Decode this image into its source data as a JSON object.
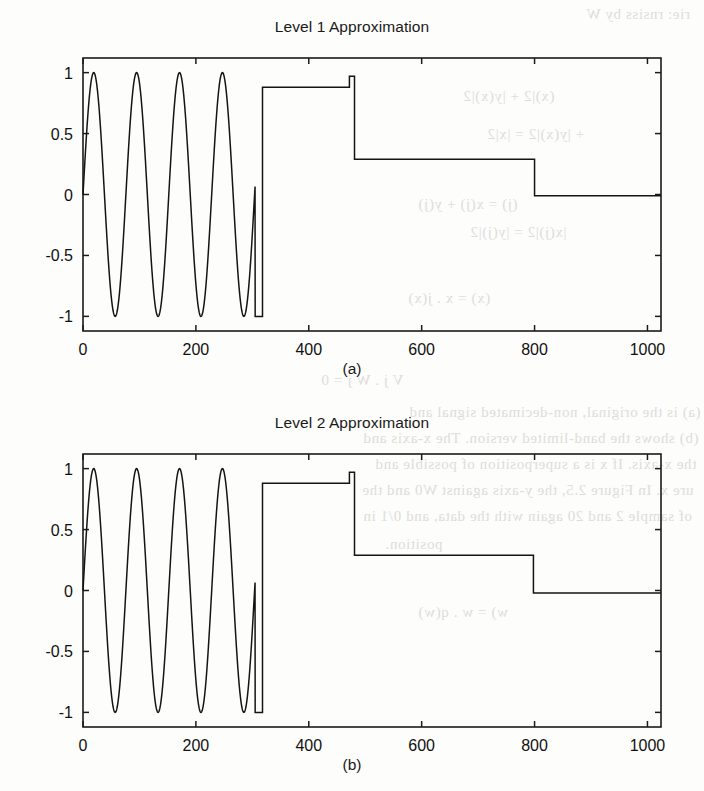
{
  "page": {
    "background_color": "#fdfdfc",
    "ink_color": "#141414",
    "ghost_text_color": "#d9d8d4",
    "ghost_lines": [
      "rie: rnsiss by W",
      "(x)|2 + |y(x)|2",
      "+ |y(x)|2 = |x|2",
      "(j) = x(j) + y(j)",
      "|x(j)|2 = |y(j)|2",
      "(x) = x . j(x)",
      "V j . W j = 0",
      "(a) is the original, non-decimated signal and",
      "(b) shows the band-limited version. The x-axis and",
      "the x-axis. If x is a superposition of possible and",
      "ure x. In Figure 2.5, the y-axis against W0 and the",
      "of sample 2 and 20 again with the data, and 0/1 in",
      "position.",
      "w) = w . q(w)"
    ]
  },
  "chart_data": [
    {
      "type": "line",
      "id": "level-1-approximation",
      "title": "Level 1 Approximation",
      "caption": "(a)",
      "xlabel": "",
      "ylabel": "",
      "xlim": [
        0,
        1024
      ],
      "ylim": [
        -1.12,
        1.12
      ],
      "xticks": [
        0,
        200,
        400,
        600,
        800,
        1000
      ],
      "xticklabels": [
        "0",
        "200",
        "400",
        "600",
        "800",
        "1000"
      ],
      "yticks": [
        -1,
        -0.5,
        0,
        0.5,
        1
      ],
      "yticklabels": [
        "-1",
        "-0.5",
        "0",
        "0.5",
        "1"
      ],
      "grid": false,
      "legend": null,
      "series": [
        {
          "name": "approximation",
          "color": "#141414",
          "segments": [
            {
              "kind": "sine",
              "x_start": 0,
              "x_end": 305,
              "amplitude": 1.0,
              "period": 76,
              "phase": 0
            },
            {
              "kind": "step",
              "x_start": 305,
              "x_end": 318,
              "y": -1.0
            },
            {
              "kind": "step",
              "x_start": 318,
              "x_end": 472,
              "y": 0.88
            },
            {
              "kind": "step",
              "x_start": 472,
              "x_end": 481,
              "y": 0.97
            },
            {
              "kind": "step",
              "x_start": 481,
              "x_end": 800,
              "y": 0.29
            },
            {
              "kind": "step",
              "x_start": 800,
              "x_end": 1024,
              "y": -0.01
            }
          ]
        }
      ]
    },
    {
      "type": "line",
      "id": "level-2-approximation",
      "title": "Level 2 Approximation",
      "caption": "(b)",
      "xlabel": "",
      "ylabel": "",
      "xlim": [
        0,
        1024
      ],
      "ylim": [
        -1.12,
        1.12
      ],
      "xticks": [
        0,
        200,
        400,
        600,
        800,
        1000
      ],
      "xticklabels": [
        "0",
        "200",
        "400",
        "600",
        "800",
        "1000"
      ],
      "yticks": [
        -1,
        -0.5,
        0,
        0.5,
        1
      ],
      "yticklabels": [
        "-1",
        "-0.5",
        "0",
        "0.5",
        "1"
      ],
      "grid": false,
      "legend": null,
      "series": [
        {
          "name": "approximation",
          "color": "#141414",
          "segments": [
            {
              "kind": "sine",
              "x_start": 0,
              "x_end": 305,
              "amplitude": 1.0,
              "period": 76,
              "phase": 0
            },
            {
              "kind": "step",
              "x_start": 305,
              "x_end": 318,
              "y": -1.0
            },
            {
              "kind": "step",
              "x_start": 318,
              "x_end": 472,
              "y": 0.88
            },
            {
              "kind": "step",
              "x_start": 472,
              "x_end": 481,
              "y": 0.97
            },
            {
              "kind": "step",
              "x_start": 481,
              "x_end": 798,
              "y": 0.29
            },
            {
              "kind": "step",
              "x_start": 798,
              "x_end": 1024,
              "y": -0.02
            }
          ]
        }
      ]
    }
  ]
}
